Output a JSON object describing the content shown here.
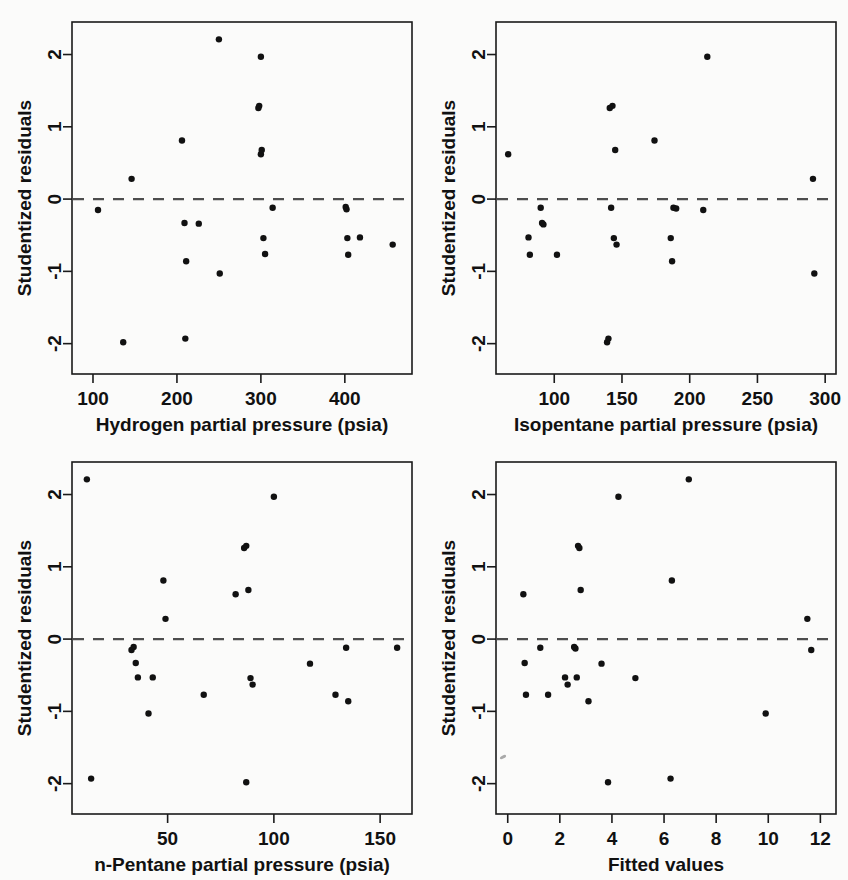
{
  "figure": {
    "background_color": "#fbfbfa",
    "point_color": "#111111",
    "axis_color": "#1a1a1a",
    "zero_line_color": "#4d4d4d",
    "shared_ylabel": "Studentized residuals",
    "panel_count": 4
  },
  "chart_data": [
    {
      "id": "a",
      "type": "scatter",
      "title": "",
      "panel_label": "(a)",
      "xlabel": "Hydrogen partial pressure (psia)",
      "ylabel": "Studentized residuals",
      "xlim": [
        75,
        480
      ],
      "ylim": [
        -2.42,
        2.45
      ],
      "xticks": [
        100,
        200,
        300,
        400
      ],
      "yticks": [
        2,
        1,
        0,
        -1,
        -2
      ],
      "xticklabels": [
        "100",
        "200",
        "300",
        "400"
      ],
      "yticklabels": [
        "2",
        "1",
        "0",
        "-1",
        "-2"
      ],
      "grid": false,
      "legend": "none",
      "reference_line": {
        "orientation": "horizontal",
        "y": 0,
        "style": "dashed"
      },
      "x": [
        106,
        136,
        146,
        206,
        209,
        211,
        226,
        250,
        251,
        297,
        298,
        300,
        301,
        303,
        305,
        314,
        401,
        402,
        403,
        404,
        418,
        457,
        300,
        210
      ],
      "y": [
        -0.15,
        -1.98,
        0.28,
        0.81,
        -0.33,
        -0.86,
        -0.34,
        2.21,
        -1.03,
        1.26,
        1.29,
        0.62,
        0.68,
        -0.54,
        -0.76,
        -0.12,
        -0.11,
        -0.14,
        -0.54,
        -0.77,
        -0.53,
        -0.63,
        1.97,
        -1.93
      ]
    },
    {
      "id": "b",
      "type": "scatter",
      "title": "",
      "panel_label": "(b)",
      "xlabel": "Isopentane partial pressure (psia)",
      "ylabel": "Studentized residuals",
      "xlim": [
        57,
        308
      ],
      "ylim": [
        -2.42,
        2.45
      ],
      "xticks": [
        100,
        150,
        200,
        250,
        300
      ],
      "yticks": [
        2,
        1,
        0,
        -1,
        -2
      ],
      "xticklabels": [
        "100",
        "150",
        "200",
        "250",
        "300"
      ],
      "yticklabels": [
        "2",
        "1",
        "0",
        "-1",
        "-2"
      ],
      "grid": false,
      "legend": "none",
      "reference_line": {
        "orientation": "horizontal",
        "y": 0,
        "style": "dashed"
      },
      "x": [
        66,
        81,
        82,
        90,
        91,
        92,
        102,
        139,
        140,
        141,
        142,
        143,
        144,
        145,
        146,
        174,
        186,
        187,
        188,
        190,
        210,
        213,
        291,
        292
      ],
      "y": [
        0.62,
        -0.53,
        -0.77,
        -0.12,
        -0.33,
        -0.35,
        -0.77,
        -1.98,
        -1.93,
        1.26,
        -0.12,
        1.29,
        -0.54,
        0.68,
        -0.63,
        0.81,
        -0.54,
        -0.86,
        -0.12,
        -0.13,
        -0.15,
        1.97,
        0.28,
        -1.03
      ]
    },
    {
      "id": "c",
      "type": "scatter",
      "title": "",
      "panel_label": "(c)",
      "xlabel": "n-Pentane partial pressure (psia)",
      "ylabel": "Studentized residuals",
      "xlim": [
        5,
        165
      ],
      "ylim": [
        -2.42,
        2.45
      ],
      "xticks": [
        50,
        100,
        150
      ],
      "yticks": [
        2,
        1,
        0,
        -1,
        -2
      ],
      "xticklabels": [
        "50",
        "100",
        "150"
      ],
      "yticklabels": [
        "2",
        "1",
        "0",
        "-1",
        "-2"
      ],
      "grid": false,
      "legend": "none",
      "reference_line": {
        "orientation": "horizontal",
        "y": 0,
        "style": "dashed"
      },
      "x": [
        12,
        14,
        33,
        34,
        35,
        36,
        41,
        43,
        48,
        49,
        67,
        82,
        86,
        87,
        88,
        89,
        90,
        100,
        117,
        129,
        134,
        135,
        158,
        87
      ],
      "y": [
        2.21,
        -1.93,
        -0.15,
        -0.11,
        -0.33,
        -0.53,
        -1.03,
        -0.53,
        0.81,
        0.28,
        -0.77,
        0.62,
        1.26,
        1.29,
        0.68,
        -0.54,
        -0.63,
        1.97,
        -0.34,
        -0.77,
        -0.12,
        -0.86,
        -0.12,
        -1.98
      ]
    },
    {
      "id": "d",
      "type": "scatter",
      "title": "",
      "panel_label": "(d)",
      "xlabel": "Fitted values",
      "ylabel": "Studentized residuals",
      "xlim": [
        -0.45,
        12.6
      ],
      "ylim": [
        -2.42,
        2.45
      ],
      "xticks": [
        0,
        2,
        4,
        6,
        8,
        10,
        12
      ],
      "yticks": [
        2,
        1,
        0,
        -1,
        -2
      ],
      "xticklabels": [
        "0",
        "2",
        "4",
        "6",
        "8",
        "10",
        "12"
      ],
      "yticklabels": [
        "2",
        "1",
        "0",
        "-1",
        "-2"
      ],
      "grid": false,
      "legend": "none",
      "reference_line": {
        "orientation": "horizontal",
        "y": 0,
        "style": "dashed"
      },
      "x": [
        0.6,
        0.65,
        0.7,
        1.25,
        1.55,
        2.2,
        2.3,
        2.55,
        2.6,
        2.65,
        2.75,
        2.8,
        3.1,
        3.6,
        3.85,
        4.25,
        4.9,
        6.25,
        6.3,
        6.95,
        9.9,
        11.5,
        11.65,
        2.7
      ],
      "y": [
        0.62,
        -0.33,
        -0.77,
        -0.12,
        -0.77,
        -0.53,
        -0.63,
        -0.11,
        -0.13,
        -0.53,
        1.26,
        0.68,
        -0.86,
        -0.34,
        -1.98,
        1.97,
        -0.54,
        -1.93,
        0.81,
        2.21,
        -1.03,
        0.28,
        -0.15,
        1.29
      ]
    }
  ]
}
